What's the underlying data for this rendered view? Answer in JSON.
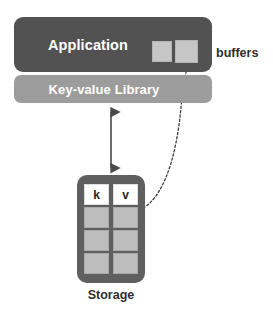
{
  "diagram": {
    "colors": {
      "application_fill": "#525252",
      "library_fill": "#9c9c9c",
      "storage_fill": "#5f5f5f",
      "cell_fill": "#bdbdbd",
      "buffer_fill": "#c6c6c6",
      "header_cell_fill": "#ffffff",
      "text_dark": "#2f2f2f",
      "text_light": "#ffffff",
      "connector": "#4a4a4a",
      "background": "#ffffff"
    },
    "application": {
      "label": "Application",
      "buffers": {
        "label": "buffers",
        "items": [
          {
            "name": "buffer-1"
          },
          {
            "name": "buffer-2"
          }
        ]
      }
    },
    "library": {
      "label": "Key-value Library"
    },
    "storage": {
      "label": "Storage",
      "columns": [
        "k",
        "v"
      ],
      "rows": [
        {
          "k": "",
          "v": ""
        },
        {
          "k": "",
          "v": ""
        },
        {
          "k": "",
          "v": ""
        }
      ]
    },
    "connectors": [
      {
        "name": "library-storage-arrow",
        "style": "solid",
        "heads": "double",
        "from": "Key-value Library",
        "to": "Storage"
      },
      {
        "name": "storage-buffer-arrow",
        "style": "dotted",
        "heads": "single",
        "from": "Storage value column",
        "to": "Application buffer"
      }
    ]
  }
}
